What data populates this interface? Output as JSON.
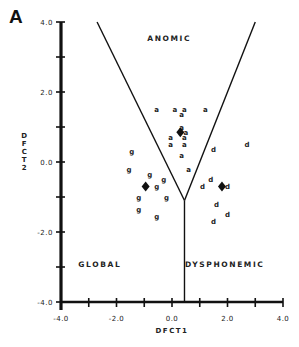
{
  "panel_label": "A",
  "chart_data": {
    "type": "scatter",
    "title": "",
    "xlabel": "DFCT1",
    "ylabel": "DFCT2",
    "xlim": [
      -4.0,
      4.0
    ],
    "ylim": [
      -4.0,
      4.0
    ],
    "x_tick_labels": [
      "-4.0",
      "-2.0",
      "0.0",
      "2.0",
      "4.0"
    ],
    "y_tick_labels": [
      "4.0",
      "2.0",
      "0.0",
      "-2.0",
      "-4.0"
    ],
    "x_ticks": [
      -4,
      -3,
      -2,
      -1,
      0,
      1,
      2,
      3,
      4
    ],
    "y_ticks": [
      4,
      3,
      2,
      1,
      0,
      -1,
      -2,
      -3,
      -4
    ],
    "grid": false,
    "legend": null,
    "regions": [
      {
        "name": "ANOMIC",
        "label_x": -0.1,
        "label_y": 3.45
      },
      {
        "name": "GLOBAL",
        "label_x": -2.6,
        "label_y": -3.0
      },
      {
        "name": "DYSPHONEMIC",
        "label_x": 1.9,
        "label_y": -3.0
      }
    ],
    "boundaries": [
      {
        "from": [
          -2.7,
          4.0
        ],
        "to": [
          0.45,
          -1.1
        ]
      },
      {
        "from": [
          3.0,
          4.0
        ],
        "to": [
          0.45,
          -1.1
        ]
      },
      {
        "from": [
          0.45,
          -1.1
        ],
        "to": [
          0.45,
          -4.0
        ]
      }
    ],
    "series": [
      {
        "name": "a",
        "marker": "a",
        "points": [
          [
            -0.55,
            1.5
          ],
          [
            0.1,
            1.5
          ],
          [
            0.45,
            1.5
          ],
          [
            1.2,
            1.5
          ],
          [
            0.35,
            1.35
          ],
          [
            0.35,
            1.0
          ],
          [
            0.5,
            0.85
          ],
          [
            -0.05,
            0.7
          ],
          [
            0.45,
            0.7
          ],
          [
            -0.05,
            0.5
          ],
          [
            0.45,
            0.5
          ],
          [
            0.35,
            0.2
          ],
          [
            0.6,
            -0.2
          ]
        ],
        "centroid": [
          0.3,
          0.85
        ]
      },
      {
        "name": "g",
        "marker": "g",
        "points": [
          [
            -1.45,
            0.3
          ],
          [
            -1.55,
            -0.2
          ],
          [
            -0.8,
            -0.35
          ],
          [
            -0.3,
            -0.5
          ],
          [
            -0.55,
            -0.7
          ],
          [
            -1.2,
            -1.0
          ],
          [
            -0.2,
            -1.0
          ],
          [
            -1.2,
            -1.35
          ],
          [
            -0.55,
            -1.55
          ]
        ],
        "centroid": [
          -0.95,
          -0.7
        ]
      },
      {
        "name": "d",
        "marker": "d",
        "points": [
          [
            2.7,
            0.5
          ],
          [
            1.5,
            0.35
          ],
          [
            1.4,
            -0.5
          ],
          [
            1.1,
            -0.7
          ],
          [
            2.0,
            -0.7
          ],
          [
            1.6,
            -1.2
          ],
          [
            2.0,
            -1.5
          ],
          [
            1.5,
            -1.7
          ]
        ],
        "centroid": [
          1.8,
          -0.7
        ]
      }
    ]
  }
}
